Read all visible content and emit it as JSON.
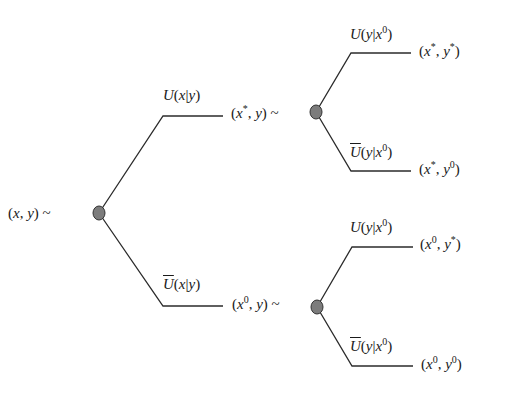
{
  "diagram": {
    "type": "decision-tree",
    "colors": {
      "line": "#2b2b2b",
      "node_fill": "#7c7c7c",
      "node_stroke": "#333333",
      "background": "#ffffff"
    },
    "root": {
      "label": "(x, y) ~"
    },
    "level1": [
      {
        "branch": "U(x|y)",
        "state": "(x*, y) ~"
      },
      {
        "branch": "Ū(x|y)",
        "state": "(x0, y) ~"
      }
    ],
    "leaves": [
      {
        "branch": "U(y|x0)",
        "outcome": "(x*, y*)"
      },
      {
        "branch": "Ū(y|x0)",
        "outcome": "(x*, y0)"
      },
      {
        "branch": "U(y|x0)",
        "outcome": "(x0, y*)"
      },
      {
        "branch": "Ū(y|x0)",
        "outcome": "(x0, y0)"
      }
    ]
  }
}
